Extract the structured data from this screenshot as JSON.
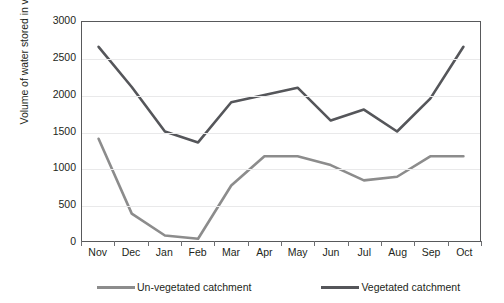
{
  "chart_data": {
    "type": "line",
    "title": "",
    "xlabel": "",
    "ylabel": "Volume of water stored in valley tanks (m3)",
    "ylabel_prefix": "Volume of water stored in valley tanks (m",
    "ylabel_sup": "3",
    "ylabel_suffix": ")",
    "categories": [
      "Nov",
      "Dec",
      "Jan",
      "Feb",
      "Mar",
      "Apr",
      "May",
      "Jun",
      "Jul",
      "Aug",
      "Sep",
      "Oct"
    ],
    "series": [
      {
        "name": "Un-vegetated catchment",
        "color": "#8c8c8c",
        "values": [
          1400,
          375,
          75,
          30,
          760,
          1160,
          1160,
          1040,
          830,
          880,
          1160,
          1160
        ]
      },
      {
        "name": "Vegetated catchment",
        "color": "#55565a",
        "values": [
          2660,
          2110,
          1500,
          1350,
          1900,
          2000,
          2100,
          1650,
          1800,
          1500,
          1950,
          2660
        ]
      }
    ],
    "ylim": [
      0,
      3000
    ],
    "yticks": [
      3000,
      2500,
      2000,
      1500,
      1000,
      500,
      0
    ],
    "grid": true,
    "legend_position": "bottom"
  },
  "legend": {
    "items": [
      {
        "label": "Un-vegetated catchment",
        "color": "#8c8c8c"
      },
      {
        "label": "Vegetated catchment",
        "color": "#55565a"
      }
    ]
  },
  "colors": {
    "axis": "#58595b",
    "grid": "#e9e9ea",
    "text": "#231f20",
    "unvegetated": "#8c8c8c",
    "vegetated": "#55565a"
  }
}
